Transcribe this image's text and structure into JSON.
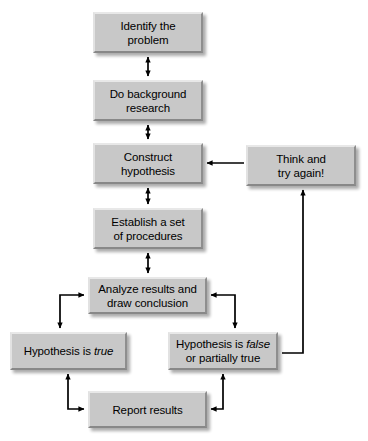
{
  "diagram": {
    "type": "flowchart",
    "background_color": "#ffffff",
    "node_fill_color": "#c8c8c8",
    "arrow_color": "#000000",
    "nodes": [
      {
        "id": "identify",
        "label": "Identify the problem",
        "lines": [
          "Identify the",
          "problem"
        ],
        "x": 93,
        "y": 12,
        "w": 110,
        "h": 41
      },
      {
        "id": "background",
        "label": "Do background research",
        "lines": [
          "Do background",
          "research"
        ],
        "x": 93,
        "y": 80,
        "w": 110,
        "h": 41
      },
      {
        "id": "hypothesis",
        "label": "Construct hypothesis",
        "lines": [
          "Construct",
          "hypothesis"
        ],
        "x": 93,
        "y": 143,
        "w": 110,
        "h": 41
      },
      {
        "id": "procedures",
        "label": "Establish a set of procedures",
        "lines": [
          "Establish a set",
          "of procedures"
        ],
        "x": 93,
        "y": 208,
        "w": 110,
        "h": 41
      },
      {
        "id": "analyze",
        "label": "Analyze results and draw conclusion",
        "lines": [
          "Analyze results and",
          "draw conclusion"
        ],
        "x": 88,
        "y": 277,
        "w": 119,
        "h": 37
      },
      {
        "id": "think",
        "label": "Think and try again!",
        "lines": [
          "Think and",
          "try again!"
        ],
        "x": 246,
        "y": 145,
        "w": 110,
        "h": 41
      },
      {
        "id": "true",
        "label": "Hypothesis is true",
        "lines": [
          "Hypothesis is true"
        ],
        "x": 10,
        "y": 332,
        "w": 117,
        "h": 38
      },
      {
        "id": "false",
        "label": "Hypothesis is false or partially true",
        "lines": [
          "Hypothesis is false",
          "or partially true"
        ],
        "x": 168,
        "y": 332,
        "w": 110,
        "h": 38
      },
      {
        "id": "report",
        "label": "Report results",
        "lines": [
          "Report results"
        ],
        "x": 88,
        "y": 391,
        "w": 119,
        "h": 37
      }
    ],
    "connections": [
      {
        "id": "identify-background",
        "from": "identify",
        "to": "background",
        "style": "double-arrow",
        "direction": "vertical"
      },
      {
        "id": "background-hypothesis",
        "from": "background",
        "to": "hypothesis",
        "style": "double-arrow",
        "direction": "vertical"
      },
      {
        "id": "hypothesis-procedures",
        "from": "hypothesis",
        "to": "procedures",
        "style": "double-arrow",
        "direction": "vertical"
      },
      {
        "id": "procedures-analyze",
        "from": "procedures",
        "to": "analyze",
        "style": "double-arrow",
        "direction": "vertical"
      },
      {
        "id": "think-hypothesis",
        "from": "think",
        "to": "hypothesis",
        "style": "single-arrow",
        "direction": "left"
      },
      {
        "id": "analyze-true",
        "from": "analyze",
        "to": "true",
        "style": "double-arrow-elbow",
        "direction": "left-down"
      },
      {
        "id": "analyze-false",
        "from": "analyze",
        "to": "false",
        "style": "double-arrow-elbow",
        "direction": "right-down"
      },
      {
        "id": "true-report",
        "from": "true",
        "to": "report",
        "style": "double-arrow-elbow",
        "direction": "down-right"
      },
      {
        "id": "false-report",
        "from": "false",
        "to": "report",
        "style": "double-arrow-elbow",
        "direction": "down-left"
      },
      {
        "id": "false-think",
        "from": "false",
        "to": "think",
        "style": "single-arrow-elbow",
        "direction": "right-up"
      }
    ]
  }
}
